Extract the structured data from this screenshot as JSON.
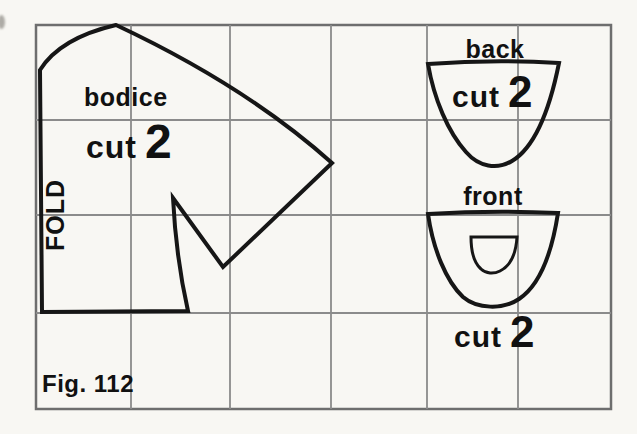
{
  "caption": "Fig. 112",
  "grid": {
    "rows": 4,
    "columns": 6
  },
  "pieces": {
    "bodice": {
      "name": "bodice",
      "cut": "cut",
      "quantity": "2",
      "fold": "FOLD"
    },
    "back": {
      "name": "back",
      "cut": "cut",
      "quantity": "2"
    },
    "front": {
      "name": "front",
      "cut": "cut",
      "quantity": "2"
    }
  },
  "colors": {
    "paper": "#f8f7f3",
    "grid_line": "#8b8b8b",
    "grid_border": "#6e6e6e",
    "pattern_line": "#161616",
    "text": "#111111"
  }
}
